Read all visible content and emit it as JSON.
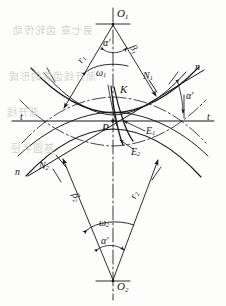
{
  "figure": {
    "kind": "engineering-line-diagram",
    "background": "#fdfdfb",
    "ink": "#15161a"
  },
  "labels": {
    "center_top": "O",
    "center_top_sub": "1",
    "center_bottom": "O",
    "center_bottom_sub": "2",
    "radius_top": "r",
    "radius_top_sub": "1",
    "radius_bottom": "r",
    "radius_bottom_sub": "2",
    "beta_top": "β",
    "beta_top_sub": "1",
    "beta_bottom": "β",
    "beta_bottom_sub": "2",
    "omega_top": "ω",
    "omega_top_sub": "1",
    "omega_bottom": "ω",
    "omega_bottom_sub": "2",
    "alpha_top": "α′",
    "alpha_right": "α′",
    "alpha_bottom": "α′",
    "normal_top_point": "N",
    "normal_top_point_sub": "1",
    "normal_bottom_point": "N",
    "normal_bottom_point_sub": "2",
    "normal_line_right": "n",
    "normal_line_left": "n",
    "tangent_left": "t",
    "tangent_right": "t",
    "contact_point": "K",
    "pitch_point": "P",
    "profile_upper": "E",
    "profile_upper_sub": "1",
    "profile_lower": "E",
    "profile_lower_sub": "2"
  },
  "bleed_through": {
    "line1": "第七章  齿轮传动",
    "line2": "渐开线齿廓的形成",
    "line3": "渐开线",
    "line4": "基圆半径"
  },
  "geometry": {
    "O1": [
      113,
      24
    ],
    "O2": [
      113,
      281
    ],
    "P": [
      113,
      121
    ],
    "K": [
      118,
      96
    ],
    "N1": [
      152,
      84
    ],
    "N2": [
      60,
      161
    ],
    "alpha_deg": 20,
    "tangent_y": 121,
    "axis_x": 113
  }
}
